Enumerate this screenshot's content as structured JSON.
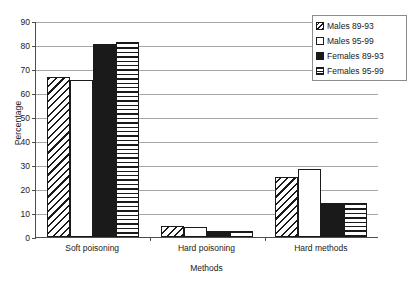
{
  "chart_data": {
    "type": "bar",
    "title": "",
    "xlabel": "Methods",
    "ylabel": "Percentage",
    "categories": [
      "Soft poisoning",
      "Hard poisoning",
      "Hard methods"
    ],
    "ylim": [
      0,
      90
    ],
    "yticks": [
      0,
      10,
      20,
      30,
      40,
      50,
      60,
      70,
      80,
      90
    ],
    "ytick_labels": [
      "0",
      "10",
      "20",
      "30",
      "40",
      "50",
      "60",
      "70",
      "80",
      "90"
    ],
    "grid": true,
    "legend_position": "top-right",
    "series": [
      {
        "name": "Males 89-93",
        "pattern": "diagonal-hatch",
        "values": [
          66.5,
          4.5,
          25.0
        ]
      },
      {
        "name": "Males 95-99",
        "pattern": "empty-white",
        "values": [
          65.5,
          4.2,
          28.2
        ]
      },
      {
        "name": "Females 89-93",
        "pattern": "solid-black",
        "values": [
          80.6,
          2.3,
          14.0
        ]
      },
      {
        "name": "Females 95-99",
        "pattern": "horizontal-line",
        "values": [
          81.4,
          2.5,
          14.2
        ]
      }
    ],
    "colors": {
      "axis": "#4d4d4d",
      "gridline": "#a6a6a6",
      "bar_edge": "#1a1a1a",
      "bar_fill_solid": "#1a1a1a",
      "bar_fill_empty": "#ffffff",
      "background": "#ffffff",
      "legend_border": "#8c8c8c"
    }
  }
}
